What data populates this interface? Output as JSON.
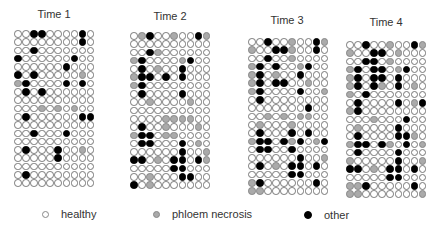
{
  "chart_data": {
    "type": "heatmap",
    "title": "",
    "legend": [
      {
        "key": "h",
        "label": "healthy",
        "color": "#ffffff"
      },
      {
        "key": "g",
        "label": "phloem necrosis",
        "color": "#aaaaaa"
      },
      {
        "key": "b",
        "label": "other",
        "color": "#000000"
      }
    ],
    "panels": [
      {
        "title": "Time 1",
        "rows": [
          "hhbbhhhhbh",
          "hhhhhhhhbh",
          "hhbhhhhhhh",
          "bhhhhhhbhh",
          "hhhhhhbhhh",
          "bhbhhhhhgh",
          "gbhhhhbhbh",
          "hbhbhhhhhh",
          "hhhhhhhhhh",
          "hhhghghghh",
          "hbhhhhhhbb",
          "hhhhhhhhhh",
          "hhbhhhbhhh",
          "hhhhhhhhhh",
          "hbhhhbhhgh",
          "hhhhhbhhhh",
          "hhhhhhhhhh",
          "hbhhhhhhhh",
          "hhhhhhhhhh"
        ]
      },
      {
        "title": "Time 2",
        "rows": [
          "hgbhhghhbg",
          "hhhhhhhhhh",
          "hhbghhhhhh",
          "gbhhhhgbhh",
          "hbhghhbhhh",
          "gbbhbhbhhh",
          "gbhhhhhhhh",
          "hbhhhhbhhh",
          "hhghhhhghh",
          "hhhhhhhhhh",
          "hhhhgggghh",
          "hbhhghhhgh",
          "gbbhgghhhh",
          "hbbhhhbhgh",
          "hhhhhhbhhg",
          "bbhghbbhbg",
          "hhhhhbbhhh",
          "hhghhhbbhh",
          "bhghhhhhhh"
        ]
      },
      {
        "title": "Time 3",
        "rows": [
          "hhbhhghhbg",
          "ghhbbghhbh",
          "hhbhhghhhh",
          "gbhbhhgbhh",
          "gbhghhbhhh",
          "gbhbbhhghh",
          "gbhhhhbhhg",
          "hbhhhhhhhh",
          "hhhhhhhbhh",
          "hhghghgghh",
          "hghhhghhhh",
          "hbhhhbhbhh",
          "gbbhbgbhgb",
          "hbbhhbhhhh",
          "hhhhhhbhhg",
          "hbhghbbhbh",
          "hhhhhbbhhh",
          "gbhhhhhhbh",
          "gghhhhhhhh"
        ]
      },
      {
        "title": "Time 4",
        "rows": [
          "hhbhhghhbg",
          "ghhbbhghhh",
          "hhbbhghhhh",
          "gbhbbhgbhh",
          "gbhbbhbhhh",
          "gbhbghbhgh",
          "ghbhhhhhhh",
          "hbhhhhbhgb",
          "gbhhhhhhhh",
          "hhhghhhbhh",
          "hghhhhbhhh",
          "hbhhhhbbgh",
          "gbbhbghbhg",
          "hbhhhhbhhh",
          "ghhhhhbhhg",
          "bbhghbbhbh",
          "hhhhhbbhhh",
          "ggbhhhhhbh",
          "gghhhhhhhg"
        ]
      }
    ]
  },
  "legend": {
    "healthy": "healthy",
    "phloem_necrosis": "phloem necrosis",
    "other": "other"
  },
  "panels": [
    {
      "title": "Time 1"
    },
    {
      "title": "Time 2"
    },
    {
      "title": "Time 3"
    },
    {
      "title": "Time 4"
    }
  ]
}
